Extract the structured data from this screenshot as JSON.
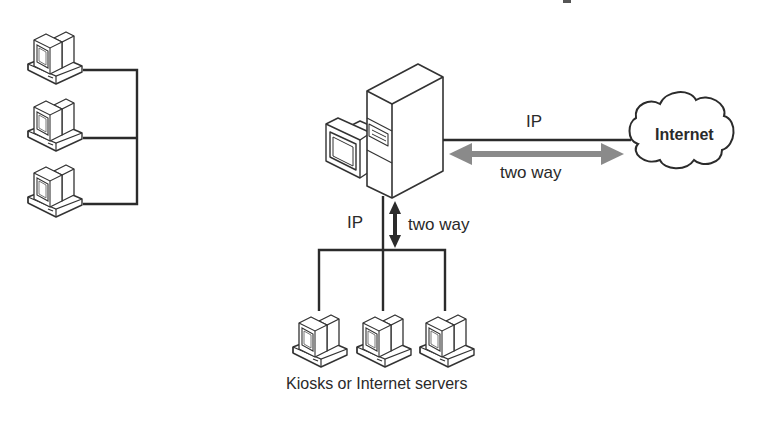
{
  "diagram": {
    "type": "network-topology",
    "nodes": {
      "left_workstations": {
        "count": 3,
        "icon": "desktop-computer-icon"
      },
      "server": {
        "icon": "server-tower-icon",
        "monitor_icon": "monitor-icon"
      },
      "internet": {
        "label": "Internet",
        "icon": "cloud-icon"
      },
      "kiosks": {
        "count": 3,
        "icon": "desktop-computer-icon",
        "caption": "Kiosks or Internet servers"
      }
    },
    "links": {
      "server_to_internet": {
        "protocol_label": "IP",
        "direction_label": "two way"
      },
      "server_to_kiosks": {
        "protocol_label": "IP",
        "direction_label": "two way"
      }
    },
    "colors": {
      "line": "#2b2b2b",
      "arrow_fill": "#8a8a8a",
      "background": "#ffffff"
    }
  }
}
